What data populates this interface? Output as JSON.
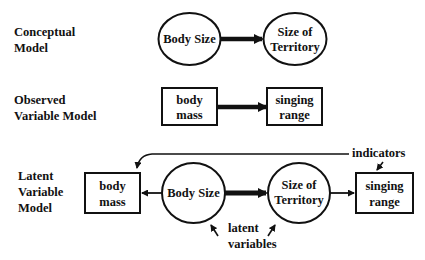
{
  "diagram": {
    "sections": {
      "conceptual": {
        "label_lines": [
          "Conceptual",
          "Model"
        ],
        "nodes": {
          "body_size": {
            "shape": "ellipse",
            "lines": [
              "Body Size"
            ]
          },
          "size_of_territory": {
            "shape": "ellipse",
            "lines": [
              "Size of",
              "Territory"
            ]
          }
        },
        "edges": [
          {
            "from": "Body Size",
            "to": "Size of Territory",
            "style": "thick-arrow"
          }
        ]
      },
      "observed": {
        "label_lines": [
          "Observed",
          "Variable Model"
        ],
        "nodes": {
          "body_mass": {
            "shape": "rectangle",
            "lines": [
              "body",
              "mass"
            ]
          },
          "singing_range": {
            "shape": "rectangle",
            "lines": [
              "singing",
              "range"
            ]
          }
        },
        "edges": [
          {
            "from": "body mass",
            "to": "singing range",
            "style": "thick-arrow"
          }
        ]
      },
      "latent": {
        "label_lines": [
          "Latent",
          "Variable",
          "Model"
        ],
        "nodes": {
          "body_mass": {
            "shape": "rectangle",
            "lines": [
              "body",
              "mass"
            ]
          },
          "body_size": {
            "shape": "ellipse",
            "lines": [
              "Body Size"
            ]
          },
          "size_of_territory": {
            "shape": "ellipse",
            "lines": [
              "Size of",
              "Territory"
            ]
          },
          "singing_range": {
            "shape": "rectangle",
            "lines": [
              "singing",
              "range"
            ]
          }
        },
        "edges": [
          {
            "from": "Body Size",
            "to": "body mass",
            "style": "thin-arrow"
          },
          {
            "from": "Body Size",
            "to": "Size of Territory",
            "style": "thick-arrow"
          },
          {
            "from": "Size of Territory",
            "to": "singing range",
            "style": "thin-arrow"
          }
        ],
        "annotations": {
          "indicators": "indicators",
          "latent_lines": [
            "latent",
            "variables"
          ]
        }
      }
    },
    "colors": {
      "stroke": "#111111",
      "background": "#ffffff"
    }
  }
}
